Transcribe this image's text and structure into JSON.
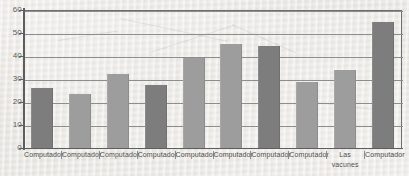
{
  "chart_data": {
    "type": "bar",
    "title": "",
    "subtitle": "",
    "xlabel": "",
    "ylabel": "",
    "ylim": [
      0,
      60
    ],
    "ytick_labels": [
      "60",
      "50",
      "40",
      "30",
      "20",
      "10",
      "0"
    ],
    "ytick_values": [
      60,
      50,
      40,
      30,
      20,
      10,
      0
    ],
    "grid": true,
    "legend": false,
    "legend_position": "none",
    "categories": [
      "Computador",
      "Computador",
      "Computador",
      "Computador",
      "Computador",
      "Computador",
      "Computador",
      "Computador",
      "Las vacunes",
      "Computador"
    ],
    "values": [
      26,
      23.5,
      32,
      27.5,
      39,
      45,
      44,
      28.5,
      34,
      54.5
    ],
    "bar_colors": [
      "#7d7d7d",
      "#9d9d9d",
      "#9d9d9d",
      "#7d7d7d",
      "#9d9d9d",
      "#9d9d9d",
      "#7d7d7d",
      "#9d9d9d",
      "#9d9d9d",
      "#7d7d7d"
    ],
    "axis_color": "#5d5d5d",
    "grid_color": "#8d8d8d",
    "background_color": "#eceae5"
  }
}
